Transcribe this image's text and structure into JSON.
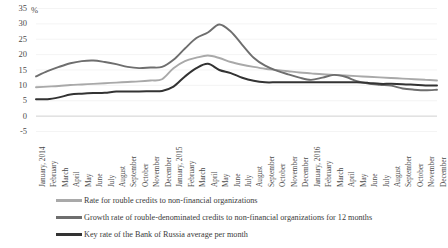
{
  "chart_data": {
    "type": "line",
    "title": "",
    "xlabel": "",
    "ylabel": "%",
    "ylim": [
      -5,
      35
    ],
    "ytick_values": [
      35,
      30,
      25,
      20,
      15,
      10,
      5,
      0,
      -5
    ],
    "grid": true,
    "legend_position": "bottom",
    "categories": [
      "January, 2014",
      "February",
      "March",
      "April",
      "May",
      "June",
      "July",
      "August",
      "September",
      "October",
      "November",
      "December",
      "January, 2015",
      "February",
      "March",
      "April",
      "May",
      "June",
      "July",
      "August",
      "September",
      "October",
      "November",
      "December",
      "January, 2016",
      "February",
      "March",
      "April",
      "May",
      "June",
      "July",
      "August",
      "September",
      "October",
      "November",
      "December"
    ],
    "series": [
      {
        "name": "Rate for rouble credits to non-financial organizations",
        "color": "#a9a9a9",
        "values": [
          9.4,
          9.6,
          9.8,
          10.1,
          10.3,
          10.5,
          10.7,
          10.9,
          11.1,
          11.3,
          11.6,
          12.0,
          15.6,
          17.9,
          19.0,
          19.7,
          18.9,
          17.6,
          16.7,
          16.0,
          15.4,
          15.0,
          14.6,
          14.2,
          13.9,
          13.6,
          13.4,
          13.2,
          13.0,
          12.8,
          12.6,
          12.4,
          12.2,
          12.0,
          11.8,
          11.6
        ]
      },
      {
        "name": "Growth rate of rouble-denominated credits to non-financial organizations for 12 months",
        "color": "#6e6e6e",
        "values": [
          12.9,
          14.6,
          16.0,
          17.2,
          17.9,
          18.1,
          17.6,
          16.9,
          16.0,
          15.6,
          15.8,
          16.0,
          18.3,
          22.0,
          25.4,
          27.2,
          29.8,
          27.5,
          23.2,
          19.0,
          16.4,
          14.8,
          13.6,
          12.5,
          11.8,
          12.5,
          13.4,
          12.8,
          11.4,
          10.6,
          10.2,
          9.9,
          9.0,
          8.6,
          8.4,
          8.6
        ]
      },
      {
        "name": "Key rate of the Bank of Russia average per month",
        "color": "#333333",
        "values": [
          5.5,
          5.5,
          6.1,
          7.0,
          7.3,
          7.5,
          7.6,
          8.0,
          8.0,
          8.0,
          8.1,
          8.2,
          9.6,
          12.9,
          15.6,
          17.0,
          15.0,
          14.0,
          12.5,
          11.5,
          11.0,
          11.0,
          11.0,
          11.0,
          11.0,
          11.0,
          11.0,
          11.0,
          11.0,
          10.8,
          10.5,
          10.5,
          10.4,
          10.2,
          10.0,
          10.0
        ]
      }
    ]
  },
  "legend": {
    "items": [
      {
        "label": "Rate for rouble credits to non-financial organizations"
      },
      {
        "label": "Growth rate of rouble-denominated credits to non-financial organizations for 12 months"
      },
      {
        "label": "Key rate of the Bank of Russia average per month"
      }
    ]
  }
}
